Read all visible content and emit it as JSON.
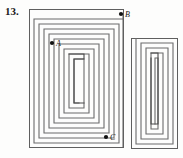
{
  "figure": {
    "problem_number": "13.",
    "type": "rectangular-spiral-maze-diagram",
    "background_color": "#fdfdfc",
    "line_color": "#6b6b6b",
    "line_color_dark": "#3a3a3a",
    "point_color": "#111111",
    "label_color": "#1a1a1a",
    "points": [
      {
        "id": "A",
        "label": "A",
        "x": 52,
        "y": 43,
        "label_x": 57,
        "label_y": 45
      },
      {
        "id": "B",
        "label": "B",
        "x": 123,
        "y": 14,
        "label_x": 128,
        "label_y": 16
      },
      {
        "id": "C",
        "label": "C",
        "x": 107,
        "y": 137,
        "label_x": 112,
        "label_y": 140
      }
    ],
    "shapes": {
      "main_spiral_label": "main rectangular spiral",
      "side_spiral_label": "narrow nested spiral",
      "outer_rect_label": "outer boundary rectangle"
    }
  }
}
